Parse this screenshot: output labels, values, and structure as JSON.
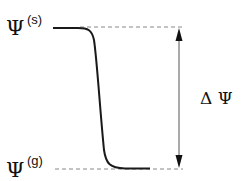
{
  "diagram": {
    "top_label": {
      "symbol": "Ψ",
      "superscript": "(s)"
    },
    "bottom_label": {
      "symbol": "Ψ",
      "superscript": "(g)"
    },
    "delta_label": "Δ Ψ",
    "colors": {
      "curve": "#1a1a1a",
      "dashed": "#888888",
      "arrow": "#333333"
    }
  }
}
